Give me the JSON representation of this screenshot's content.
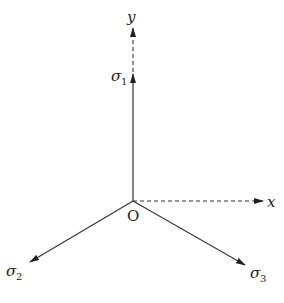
{
  "diagram": {
    "origin": {
      "label": "O"
    },
    "axes": [
      {
        "id": "y",
        "label": "y",
        "style": "dashed"
      },
      {
        "id": "x",
        "label": "x",
        "style": "dashed"
      }
    ],
    "vectors": [
      {
        "id": "sigma1",
        "symbol": "σ",
        "subscript": "1",
        "style": "solid"
      },
      {
        "id": "sigma2",
        "symbol": "σ",
        "subscript": "2",
        "style": "solid"
      },
      {
        "id": "sigma3",
        "symbol": "σ",
        "subscript": "3",
        "style": "solid"
      }
    ],
    "colors": {
      "line": "#333333",
      "background": "#ffffff"
    }
  }
}
